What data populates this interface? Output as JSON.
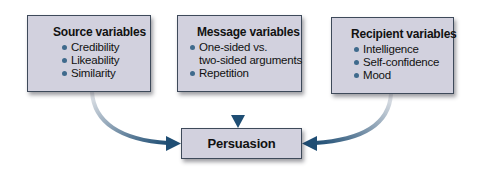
{
  "diagram": {
    "source": {
      "title": "Source variables",
      "items": [
        "Credibility",
        "Likeability",
        "Similarity"
      ]
    },
    "message": {
      "title": "Message variables",
      "items": [
        "One-sided vs.",
        "two-sided arguments",
        "Repetition"
      ]
    },
    "recipient": {
      "title": "Recipient variables",
      "items": [
        "Intelligence",
        "Self-confidence",
        "Mood"
      ]
    },
    "outcome": {
      "label": "Persuasion"
    },
    "edges": [
      {
        "from": "Source variables",
        "to": "Persuasion"
      },
      {
        "from": "Message variables",
        "to": "Persuasion"
      },
      {
        "from": "Recipient variables",
        "to": "Persuasion"
      }
    ],
    "colors": {
      "box_fill": "#d2d1de",
      "box_border": "#3e4a5a",
      "arrow": "#1f4e74",
      "bullet": "#3f6a8c"
    }
  }
}
